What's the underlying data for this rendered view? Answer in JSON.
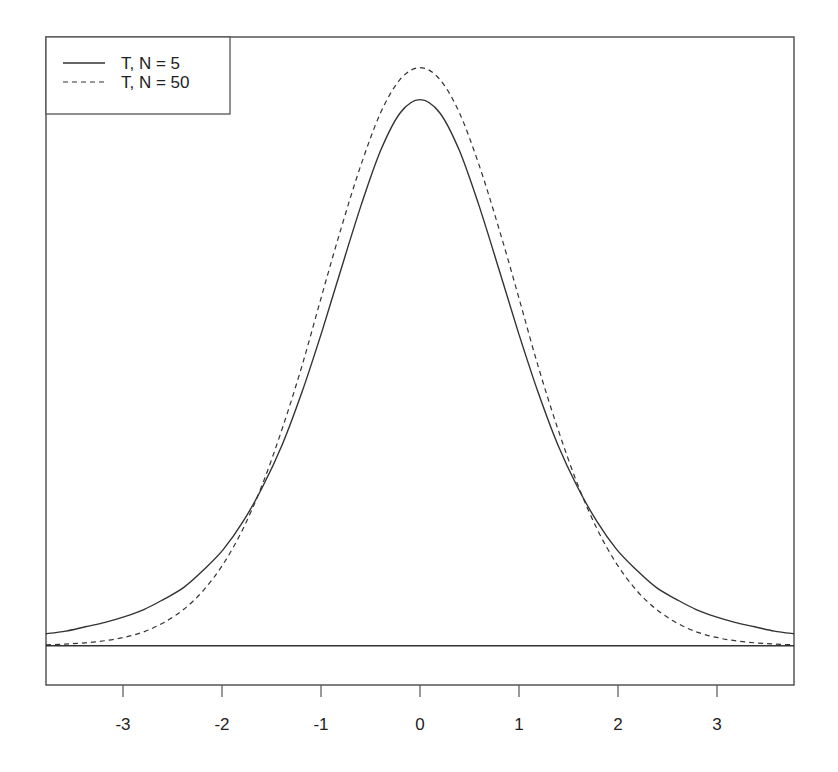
{
  "chart_data": {
    "type": "line",
    "title": "",
    "xlabel": "",
    "ylabel": "",
    "xlim": [
      -3.8,
      3.8
    ],
    "ylim": [
      -0.027,
      0.418
    ],
    "grid": false,
    "legend_position": "top-left",
    "x_ticks": [
      -3,
      -2,
      -1,
      0,
      1,
      2,
      3
    ],
    "x_tick_labels": [
      "-3",
      "-2",
      "-1",
      "0",
      "1",
      "2",
      "3"
    ],
    "y_ticks": [],
    "horizontal_reference_line": 0,
    "x": [
      -3.8,
      -3.6,
      -3.4,
      -3.2,
      -3.0,
      -2.8,
      -2.6,
      -2.4,
      -2.2,
      -2.0,
      -1.8,
      -1.6,
      -1.4,
      -1.2,
      -1.0,
      -0.8,
      -0.6,
      -0.4,
      -0.2,
      0.0,
      0.2,
      0.4,
      0.6,
      0.8,
      1.0,
      1.2,
      1.4,
      1.6,
      1.8,
      2.0,
      2.2,
      2.4,
      2.6,
      2.8,
      3.0,
      3.2,
      3.4,
      3.6,
      3.8
    ],
    "series": [
      {
        "name": "T, N = 5",
        "line_style": "solid",
        "color": "#333333",
        "values": [
          0.0082,
          0.01,
          0.013,
          0.016,
          0.02,
          0.025,
          0.032,
          0.04,
          0.052,
          0.066,
          0.085,
          0.109,
          0.138,
          0.174,
          0.215,
          0.259,
          0.302,
          0.34,
          0.366,
          0.375,
          0.366,
          0.34,
          0.302,
          0.259,
          0.215,
          0.174,
          0.138,
          0.109,
          0.085,
          0.066,
          0.052,
          0.04,
          0.032,
          0.025,
          0.02,
          0.016,
          0.013,
          0.01,
          0.0082
        ]
      },
      {
        "name": "T, N = 50",
        "line_style": "dashed",
        "color": "#333333",
        "values": [
          0.0006,
          0.0011,
          0.002,
          0.0034,
          0.0058,
          0.0097,
          0.016,
          0.025,
          0.038,
          0.056,
          0.08,
          0.111,
          0.149,
          0.192,
          0.24,
          0.287,
          0.33,
          0.366,
          0.389,
          0.397,
          0.389,
          0.366,
          0.33,
          0.287,
          0.24,
          0.192,
          0.149,
          0.111,
          0.08,
          0.056,
          0.038,
          0.025,
          0.016,
          0.0097,
          0.0058,
          0.0034,
          0.002,
          0.0011,
          0.0006
        ]
      }
    ]
  },
  "legend": {
    "items": [
      {
        "label": "T, N = 5",
        "style": "solid"
      },
      {
        "label": "T, N = 50",
        "style": "dashed"
      }
    ]
  },
  "axis": {
    "x_tick_labels": [
      "-3",
      "-2",
      "-1",
      "0",
      "1",
      "2",
      "3"
    ]
  },
  "colors": {
    "line": "#333333",
    "frame": "#555555",
    "background": "#ffffff"
  }
}
